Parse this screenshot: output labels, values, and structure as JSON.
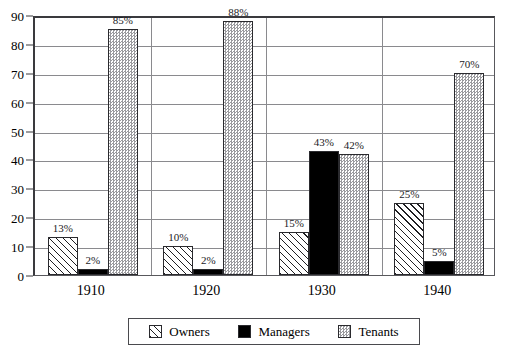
{
  "chart_data": {
    "type": "bar",
    "title": "",
    "xlabel": "",
    "ylabel": "",
    "ylim": [
      0,
      90
    ],
    "ytick_step": 10,
    "yticks": [
      0,
      10,
      20,
      30,
      40,
      50,
      60,
      70,
      80,
      90
    ],
    "grid": true,
    "legend_position": "bottom",
    "label_suffix": "%",
    "categories": [
      "1910",
      "1920",
      "1930",
      "1940"
    ],
    "series": [
      {
        "name": "Owners",
        "pattern": "diagonal-hatch",
        "color": "#ffffff",
        "values": [
          13,
          10,
          15,
          25
        ],
        "labels": [
          "13%",
          "10%",
          "15%",
          "25%"
        ]
      },
      {
        "name": "Managers",
        "pattern": "solid-black",
        "color": "#000000",
        "values": [
          2,
          2,
          43,
          5
        ],
        "labels": [
          "2%",
          "2%",
          "43%",
          "5%"
        ]
      },
      {
        "name": "Tenants",
        "pattern": "checkerboard-gray",
        "color": "#9a9a9e",
        "values": [
          85,
          88,
          42,
          70
        ],
        "labels": [
          "85%",
          "88%",
          "42%",
          "70%"
        ]
      }
    ]
  },
  "legend": {
    "items": [
      {
        "label": "Owners"
      },
      {
        "label": "Managers"
      },
      {
        "label": "Tenants"
      }
    ]
  },
  "artifacts": {
    "top_crop_text": ""
  }
}
